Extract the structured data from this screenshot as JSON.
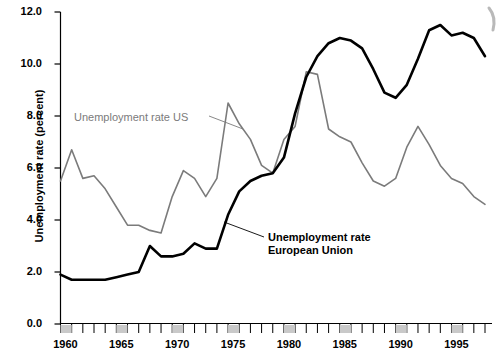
{
  "chart_data": {
    "type": "line",
    "title": "",
    "xlabel": "",
    "ylabel": "Unemployment rate (percent)",
    "xlim": [
      1960,
      1998
    ],
    "ylim": [
      0.0,
      12.0
    ],
    "grid": false,
    "legend_position": "inline-annotations",
    "y_ticks": [
      "0.0",
      "2.0",
      "4.0",
      "6.0",
      "8.0",
      "10.0",
      "12.0"
    ],
    "y_tick_values": [
      0.0,
      2.0,
      4.0,
      6.0,
      8.0,
      10.0,
      12.0
    ],
    "x_ticks": [
      "1960",
      "1965",
      "1970",
      "1975",
      "1980",
      "1985",
      "1990",
      "1995"
    ],
    "x_tick_values": [
      1960,
      1965,
      1970,
      1975,
      1980,
      1985,
      1990,
      1995
    ],
    "x": [
      1960,
      1961,
      1962,
      1963,
      1964,
      1965,
      1966,
      1967,
      1968,
      1969,
      1970,
      1971,
      1972,
      1973,
      1974,
      1975,
      1976,
      1977,
      1978,
      1979,
      1980,
      1981,
      1982,
      1983,
      1984,
      1985,
      1986,
      1987,
      1988,
      1989,
      1990,
      1991,
      1992,
      1993,
      1994,
      1995,
      1996,
      1997,
      1998
    ],
    "series": [
      {
        "name": "Unemployment rate US",
        "color": "#7b7b7b",
        "width": 1.6,
        "values": [
          5.5,
          6.7,
          5.6,
          5.7,
          5.2,
          4.5,
          3.8,
          3.8,
          3.6,
          3.5,
          4.9,
          5.9,
          5.6,
          4.9,
          5.6,
          8.5,
          7.7,
          7.1,
          6.1,
          5.8,
          7.1,
          7.6,
          9.7,
          9.6,
          7.5,
          7.2,
          7.0,
          6.2,
          5.5,
          5.3,
          5.6,
          6.8,
          7.6,
          6.9,
          6.1,
          5.6,
          5.4,
          4.9,
          4.6
        ]
      },
      {
        "name": "Unemployment rate European Union",
        "color": "#000000",
        "width": 2.6,
        "values": [
          1.9,
          1.7,
          1.7,
          1.7,
          1.7,
          1.8,
          1.9,
          2.0,
          3.0,
          2.6,
          2.6,
          2.7,
          3.1,
          2.9,
          2.9,
          4.2,
          5.1,
          5.5,
          5.7,
          5.8,
          6.4,
          8.1,
          9.5,
          10.3,
          10.8,
          11.0,
          10.9,
          10.6,
          9.8,
          8.9,
          8.7,
          9.2,
          10.2,
          11.3,
          11.5,
          11.1,
          11.2,
          11.0,
          10.3
        ]
      }
    ],
    "annotations": [
      {
        "name": "us-label",
        "text": "Unemployment rate US",
        "color": "#7b7b7b",
        "lines": [
          "Unemployment rate US"
        ]
      },
      {
        "name": "eu-label",
        "text": "Unemployment rate European Union",
        "color": "#000000",
        "lines": [
          "Unemployment rate",
          "European Union"
        ]
      }
    ]
  },
  "axis": {
    "y_title": "Unemployment rate (percent)",
    "y_ticks": [
      {
        "label": "12.0"
      },
      {
        "label": "10.0"
      },
      {
        "label": "8.0"
      },
      {
        "label": "6.0"
      },
      {
        "label": "4.0"
      },
      {
        "label": "2.0"
      },
      {
        "label": "0.0"
      }
    ],
    "x_ticks": [
      {
        "label": "1960"
      },
      {
        "label": "1965"
      },
      {
        "label": "1970"
      },
      {
        "label": "1975"
      },
      {
        "label": "1980"
      },
      {
        "label": "1985"
      },
      {
        "label": "1990"
      },
      {
        "label": "1995"
      }
    ]
  },
  "annotations": {
    "us_line1": "Unemployment rate US",
    "eu_line1": "Unemployment rate",
    "eu_line2": "European Union"
  },
  "colors": {
    "us_series": "#7b7b7b",
    "eu_series": "#000000",
    "axis": "#000000",
    "tick_band": "#c9c9c9",
    "background": "#ffffff"
  }
}
